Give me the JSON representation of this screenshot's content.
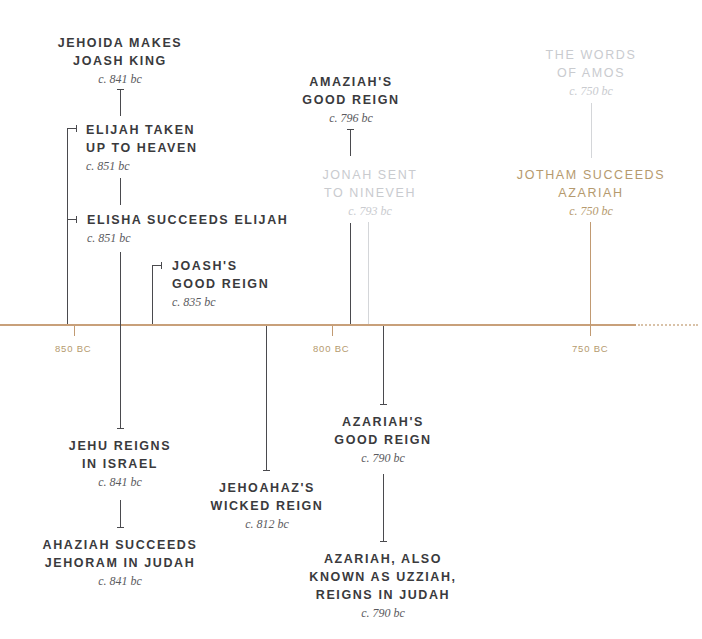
{
  "timeline": {
    "axis_color": "#c8a07a",
    "accent_gold": "#b59a6e",
    "ticks": [
      {
        "label": "850 BC",
        "x": 74
      },
      {
        "label": "800 BC",
        "x": 332
      },
      {
        "label": "750 BC",
        "x": 590
      }
    ]
  },
  "events": {
    "jehoida": {
      "title1": "JEHOIDA MAKES",
      "title2": "JOASH KING",
      "date": "c. 841 bc"
    },
    "elijah": {
      "title1": "ELIJAH TAKEN",
      "title2": "UP TO HEAVEN",
      "date": "c. 851 bc"
    },
    "elisha": {
      "title1": "ELISHA SUCCEEDS ELIJAH",
      "date": "c. 851 bc"
    },
    "joash": {
      "title1": "JOASH'S",
      "title2": "GOOD REIGN",
      "date": "c. 835 bc"
    },
    "amaziah": {
      "title1": "AMAZIAH'S",
      "title2": "GOOD REIGN",
      "date": "c. 796 bc"
    },
    "jonah": {
      "title1": "JONAH SENT",
      "title2": "TO NINEVEH",
      "date": "c. 793 bc"
    },
    "amos": {
      "title1": "THE WORDS",
      "title2": "OF AMOS",
      "date": "c. 750 bc"
    },
    "jotham": {
      "title1": "JOTHAM SUCCEEDS",
      "title2": "AZARIAH",
      "date": "c. 750 bc"
    },
    "jehu": {
      "title1": "JEHU REIGNS",
      "title2": "IN ISRAEL",
      "date": "c. 841 bc"
    },
    "ahaziah": {
      "title1": "AHAZIAH SUCCEEDS",
      "title2": "JEHORAM IN JUDAH",
      "date": "c. 841 bc"
    },
    "jehoahaz": {
      "title1": "JEHOAHAZ'S",
      "title2": "WICKED REIGN",
      "date": "c. 812 bc"
    },
    "azariah_good": {
      "title1": "AZARIAH'S",
      "title2": "GOOD REIGN",
      "date": "c. 790 bc"
    },
    "azariah_uzziah": {
      "title1": "AZARIAH, ALSO",
      "title2": "KNOWN AS UZZIAH,",
      "title3": "REIGNS IN JUDAH",
      "date": "c. 790 bc"
    }
  }
}
